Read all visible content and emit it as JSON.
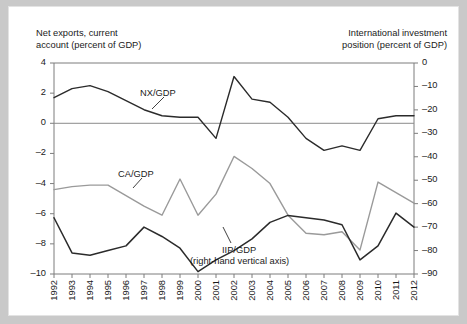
{
  "figure": {
    "left_axis_caption": "Net exports, current\naccount (percent of GDP)",
    "right_axis_caption": "International investment\nposition (percent of GDP)",
    "labels": {
      "nx": "NX/GDP",
      "ca": "CA/GDP",
      "iip": "IIP/GDP",
      "iip_note": "(right-hand vertical axis)"
    },
    "colors": {
      "nx_line": "#2b2b2b",
      "ca_line": "#9a9a9a",
      "iip_line": "#2b2b2b",
      "axis": "#7d7d7d",
      "zero_line": "#8a8a8a",
      "text": "#1a1a1a",
      "frame": "#e3e3e3",
      "page_background": "#c9c9c9"
    }
  },
  "chart_data": {
    "type": "line",
    "title": "",
    "xlabel": "",
    "ylabel": "Net exports, current account (percent of GDP)",
    "y2label": "International investment position (percent of GDP)",
    "grid": false,
    "legend": "inline-annotations",
    "x": [
      1992,
      1993,
      1994,
      1995,
      1996,
      1997,
      1998,
      1999,
      2000,
      2001,
      2002,
      2003,
      2004,
      2005,
      2006,
      2007,
      2008,
      2009,
      2010,
      2011,
      2012
    ],
    "xtick_labels": [
      "1992",
      "1993",
      "1994",
      "1995",
      "1996",
      "1997",
      "1998",
      "1999",
      "2000",
      "2001",
      "2002",
      "2003",
      "2004",
      "2005",
      "2006",
      "2007",
      "2008",
      "2009",
      "2010",
      "2011",
      "2012"
    ],
    "ylim": [
      -10,
      4
    ],
    "ytick_labels": [
      "4",
      "2",
      "0",
      "-2",
      "-4",
      "-6",
      "-8",
      "-10"
    ],
    "ytick_values": [
      4,
      2,
      0,
      -2,
      -4,
      -6,
      -8,
      -10
    ],
    "y2lim": [
      -90,
      0
    ],
    "y2tick_labels": [
      "0",
      "-10",
      "-20",
      "-30",
      "-40",
      "-50",
      "-60",
      "-70",
      "-80",
      "-90"
    ],
    "y2tick_values": [
      0,
      -10,
      -20,
      -30,
      -40,
      -50,
      -60,
      -70,
      -80,
      -90
    ],
    "series": [
      {
        "name": "NX/GDP",
        "axis": "left",
        "color": "#2b2b2b",
        "values": [
          1.7,
          2.3,
          2.5,
          2.1,
          1.5,
          0.9,
          0.5,
          0.4,
          0.4,
          -1.0,
          3.1,
          1.6,
          1.4,
          0.4,
          -1.0,
          -1.8,
          -1.5,
          -1.8,
          0.3,
          0.5,
          0.5
        ]
      },
      {
        "name": "CA/GDP",
        "axis": "left",
        "color": "#9a9a9a",
        "values": [
          -4.4,
          -4.2,
          -4.1,
          -4.1,
          -4.8,
          -5.5,
          -6.1,
          -3.7,
          -6.1,
          -4.7,
          -2.2,
          -3.0,
          -4.0,
          -6.1,
          -7.3,
          -7.4,
          -7.2,
          -8.4,
          -3.9,
          -4.6,
          -5.3
        ]
      },
      {
        "name": "IIP/GDP",
        "axis": "right",
        "color": "#2b2b2b",
        "values": [
          -66,
          -81,
          -82,
          -80,
          -78,
          -70,
          -74,
          -79,
          -89,
          -84,
          -80,
          -75,
          -68,
          -65,
          -66,
          -67,
          -69,
          -84,
          -78,
          -64,
          -70
        ]
      }
    ],
    "annotations": [
      {
        "text": "NX/GDP",
        "points_to_series": "NX/GDP"
      },
      {
        "text": "CA/GDP",
        "points_to_series": "CA/GDP"
      },
      {
        "text": "IIP/GDP",
        "points_to_series": "IIP/GDP"
      },
      {
        "text": "(right-hand vertical axis)",
        "points_to_series": "IIP/GDP"
      }
    ]
  }
}
